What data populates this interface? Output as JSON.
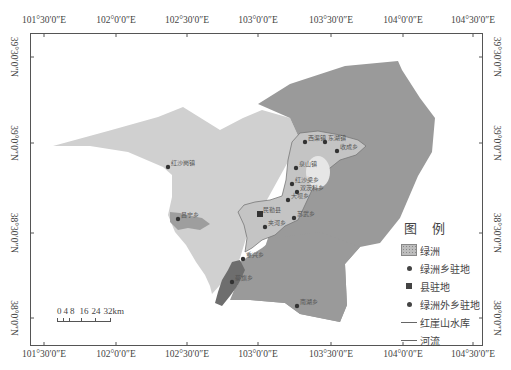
{
  "map": {
    "title": "",
    "frame": {
      "left": 30,
      "top": 33,
      "width": 453,
      "height": 313
    },
    "longitude_ticks": [
      {
        "label": "101°30′0″E",
        "x": 44
      },
      {
        "label": "102°0′0″E",
        "x": 116
      },
      {
        "label": "102°30′0″E",
        "x": 187
      },
      {
        "label": "103°0′0″E",
        "x": 258
      },
      {
        "label": "103°30′0″E",
        "x": 331
      },
      {
        "label": "104°0′0″E",
        "x": 403
      },
      {
        "label": "104°30′0″E",
        "x": 473
      }
    ],
    "latitude_ticks": [
      {
        "label": "39°30′0″N",
        "y": 57
      },
      {
        "label": "39°0′0″N",
        "y": 143
      },
      {
        "label": "38°30′0″N",
        "y": 233
      },
      {
        "label": "38°0′0″N",
        "y": 318
      }
    ],
    "places": [
      {
        "name": "红沙岗镇",
        "x": 168,
        "y": 167,
        "type": "outside"
      },
      {
        "name": "昌宁乡",
        "x": 178,
        "y": 219,
        "type": "outside"
      },
      {
        "name": "西渠镇",
        "x": 305,
        "y": 142,
        "type": "oasis"
      },
      {
        "name": "东湖镇",
        "x": 325,
        "y": 142,
        "type": "oasis"
      },
      {
        "name": "收成乡",
        "x": 337,
        "y": 151,
        "type": "oasis"
      },
      {
        "name": "泉山镇",
        "x": 296,
        "y": 168,
        "type": "oasis"
      },
      {
        "name": "红沙梁乡",
        "x": 292,
        "y": 184,
        "type": "oasis"
      },
      {
        "name": "双茨科乡",
        "x": 297,
        "y": 192,
        "type": "oasis"
      },
      {
        "name": "大坝乡",
        "x": 288,
        "y": 200,
        "type": "oasis"
      },
      {
        "name": "民勤县",
        "x": 260,
        "y": 214,
        "type": "county"
      },
      {
        "name": "苏武乡",
        "x": 294,
        "y": 218,
        "type": "oasis"
      },
      {
        "name": "夹河乡",
        "x": 265,
        "y": 227,
        "type": "oasis"
      },
      {
        "name": "重兴乡",
        "x": 243,
        "y": 259,
        "type": "outside"
      },
      {
        "name": "蔡旗乡",
        "x": 232,
        "y": 282,
        "type": "outside"
      },
      {
        "name": "南湖乡",
        "x": 297,
        "y": 306,
        "type": "outside"
      }
    ],
    "colors": {
      "background": "#ffffff",
      "west_region": "#d0d0d0",
      "east_region": "#9a9a9a",
      "oasis": "#c4c4c4",
      "lake": "#e6e6e6",
      "river_zone": "#8a8a8a",
      "dot": "#333333"
    }
  },
  "legend": {
    "title": "图 例",
    "items": [
      {
        "symbol": "oasis-fill",
        "label": "绿洲"
      },
      {
        "symbol": "dot",
        "label": "绿洲乡驻地"
      },
      {
        "symbol": "square",
        "label": "县驻地"
      },
      {
        "symbol": "dot",
        "label": "绿洲外乡驻地"
      },
      {
        "symbol": "line",
        "label": "红崖山水库"
      },
      {
        "symbol": "line",
        "label": "河流"
      }
    ]
  },
  "scalebar": {
    "labels": [
      "0",
      "4",
      "8",
      "16",
      "24",
      "32km"
    ]
  }
}
